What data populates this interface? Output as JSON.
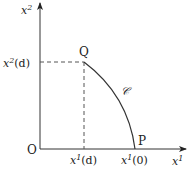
{
  "diagram": {
    "axes": {
      "origin_label": "O",
      "x_axis_label_base": "x",
      "x_axis_label_sup": "1",
      "y_axis_label_base": "x",
      "y_axis_label_sup": "2"
    },
    "points": {
      "Q": {
        "label": "Q"
      },
      "P": {
        "label": "P"
      }
    },
    "curve_label": "𝒞",
    "ticks": {
      "x_d": {
        "base": "x",
        "sup": "1",
        "arg": "(d)"
      },
      "x_0": {
        "base": "x",
        "sup": "1",
        "arg": "(0)"
      },
      "y_d": {
        "base": "x",
        "sup": "2",
        "arg": "(d)"
      }
    },
    "colors": {
      "line": "#333333",
      "dashed": "#555555",
      "text": "#222222"
    }
  }
}
